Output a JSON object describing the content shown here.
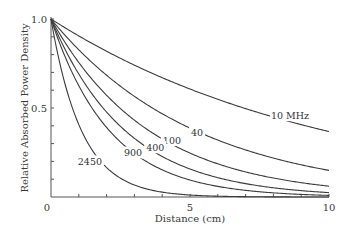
{
  "chart_data": {
    "type": "line",
    "title": "",
    "xlabel": "Distance (cm)",
    "ylabel": "Relative Absorbed Power Density",
    "xlim": [
      0,
      10
    ],
    "ylim": [
      0,
      1.0
    ],
    "x_ticks": [
      0,
      5,
      10
    ],
    "x_minor_tick_step": 1,
    "y_ticks": [
      0,
      0.5,
      1.0
    ],
    "y_tick_labels": [
      "0",
      "0.5",
      "1.0"
    ],
    "y_minor_tick_step": 0.1,
    "grid": false,
    "legend": "inline curve labels",
    "x": [
      0,
      1,
      2,
      3,
      4,
      5,
      6,
      7,
      8,
      9,
      10
    ],
    "series": [
      {
        "name": "10 MHz",
        "label": "10 MHz",
        "decay_per_cm": 0.1,
        "values": [
          1.0,
          0.9,
          0.82,
          0.74,
          0.67,
          0.61,
          0.55,
          0.5,
          0.45,
          0.41,
          0.37
        ]
      },
      {
        "name": "40",
        "label": "40",
        "decay_per_cm": 0.19,
        "values": [
          1.0,
          0.83,
          0.68,
          0.57,
          0.47,
          0.39,
          0.32,
          0.26,
          0.22,
          0.18,
          0.15
        ]
      },
      {
        "name": "100",
        "label": "100",
        "decay_per_cm": 0.28,
        "values": [
          1.0,
          0.76,
          0.57,
          0.43,
          0.33,
          0.25,
          0.19,
          0.14,
          0.11,
          0.08,
          0.06
        ]
      },
      {
        "name": "400",
        "label": "400",
        "decay_per_cm": 0.37,
        "values": [
          1.0,
          0.69,
          0.48,
          0.33,
          0.23,
          0.16,
          0.11,
          0.08,
          0.05,
          0.04,
          0.03
        ]
      },
      {
        "name": "900",
        "label": "900",
        "decay_per_cm": 0.47,
        "values": [
          1.0,
          0.63,
          0.39,
          0.24,
          0.15,
          0.1,
          0.06,
          0.04,
          0.02,
          0.01,
          0.01
        ]
      },
      {
        "name": "2450",
        "label": "2450",
        "decay_per_cm": 0.9,
        "values": [
          1.0,
          0.41,
          0.17,
          0.07,
          0.03,
          0.01,
          0.0,
          0.0,
          0.0,
          0.0,
          0.0
        ]
      }
    ],
    "label_positions": [
      {
        "series": "10 MHz",
        "x_cm": 8.6,
        "y": 0.46
      },
      {
        "series": "40",
        "x_cm": 5.25,
        "y": 0.36
      },
      {
        "series": "100",
        "x_cm": 4.35,
        "y": 0.32
      },
      {
        "series": "400",
        "x_cm": 3.75,
        "y": 0.28
      },
      {
        "series": "900",
        "x_cm": 2.95,
        "y": 0.25
      },
      {
        "series": "2450",
        "x_cm": 1.4,
        "y": 0.2
      }
    ]
  }
}
